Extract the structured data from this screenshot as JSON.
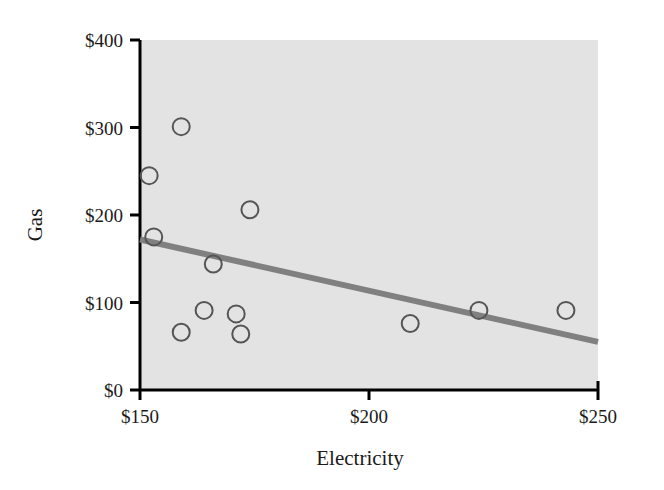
{
  "chart_data": {
    "type": "scatter",
    "title": "",
    "xlabel": "Electricity",
    "ylabel": "Gas",
    "xlim": [
      150,
      250
    ],
    "ylim": [
      0,
      400
    ],
    "grid": false,
    "legend": false,
    "xticks": [
      "$150",
      "$200",
      "$250"
    ],
    "xtick_values": [
      150,
      200,
      250
    ],
    "yticks": [
      "$0",
      "$100",
      "$200",
      "$300",
      "$400"
    ],
    "ytick_values": [
      0,
      100,
      200,
      300,
      400
    ],
    "points": [
      {
        "x": 152,
        "y": 245
      },
      {
        "x": 153,
        "y": 175
      },
      {
        "x": 159,
        "y": 301
      },
      {
        "x": 159,
        "y": 66
      },
      {
        "x": 164,
        "y": 91
      },
      {
        "x": 166,
        "y": 144
      },
      {
        "x": 171,
        "y": 87
      },
      {
        "x": 172,
        "y": 64
      },
      {
        "x": 174,
        "y": 206
      },
      {
        "x": 209,
        "y": 76
      },
      {
        "x": 224,
        "y": 91
      },
      {
        "x": 243,
        "y": 91
      }
    ],
    "trendline": {
      "x0": 150,
      "y0": 172,
      "x1": 250,
      "y1": 55
    },
    "colors": {
      "plot_background": "#e3e3e3",
      "axis": "#000000",
      "marker_stroke": "#555555",
      "marker_fill": "none",
      "trendline": "#808080",
      "text": "#1a1a1a"
    }
  }
}
